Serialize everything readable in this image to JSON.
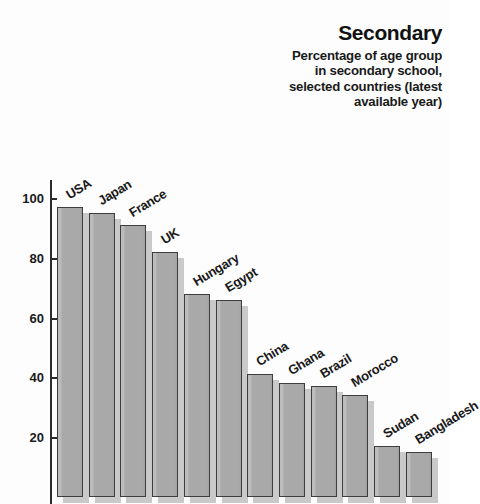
{
  "header": {
    "title": "Secondary",
    "subtitle_lines": [
      "Percentage of age group",
      "in secondary school,",
      "selected countries (latest",
      "available year)"
    ]
  },
  "axis": {
    "y_ticks": [
      "100",
      "80",
      "60",
      "40",
      "20"
    ]
  },
  "colors": {
    "bar_fill": "#a9a9a9",
    "bar_border": "#3d3d3d",
    "bar_shadow": "#c9c9c9",
    "text": "#1a1a1a",
    "background": "#fdfdfd"
  },
  "chart_data": {
    "type": "bar",
    "title": "Secondary",
    "subtitle": "Percentage of age group in secondary school, selected countries (latest available year)",
    "xlabel": "",
    "ylabel": "",
    "ylim": [
      0,
      100
    ],
    "yticks": [
      20,
      40,
      60,
      80,
      100
    ],
    "grid": false,
    "legend": "none",
    "categories": [
      "USA",
      "Japan",
      "France",
      "UK",
      "Hungary",
      "Egypt",
      "China",
      "Ghana",
      "Brazil",
      "Morocco",
      "Sudan",
      "Bangladesh"
    ],
    "values": [
      97,
      95,
      91,
      82,
      68,
      66,
      41,
      38,
      37,
      34,
      17,
      15
    ]
  }
}
